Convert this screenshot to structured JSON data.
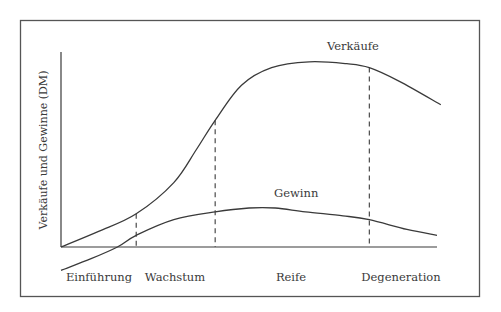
{
  "chart_data": {
    "type": "line",
    "title": "",
    "xlabel": "",
    "ylabel": "Verkäufe und Gewinne (DM)",
    "xlim": [
      0,
      100
    ],
    "ylim": [
      -15,
      100
    ],
    "grid": false,
    "legend": "none",
    "phases": [
      {
        "label": "Einführung",
        "start": 0,
        "end": 20
      },
      {
        "label": "Wachstum",
        "start": 20,
        "end": 41
      },
      {
        "label": "Reife",
        "start": 41,
        "end": 82
      },
      {
        "label": "Degeneration",
        "start": 82,
        "end": 101
      }
    ],
    "phase_boundaries": [
      20,
      41,
      82
    ],
    "series": [
      {
        "name": "Verkäufe",
        "label": "Verkäufe",
        "color": "#3a3a3a",
        "x": [
          0,
          10,
          20,
          30,
          36,
          41,
          48,
          56,
          66,
          76,
          82,
          90,
          101
        ],
        "y": [
          0,
          8,
          17,
          33,
          50,
          65,
          83,
          92,
          95,
          94,
          92,
          85,
          73
        ]
      },
      {
        "name": "Gewinn",
        "label": "Gewinn",
        "color": "#3a3a3a",
        "x": [
          0,
          8,
          15,
          20,
          30,
          41,
          50,
          57,
          65,
          75,
          82,
          92,
          100
        ],
        "y": [
          -12,
          -6,
          0,
          6,
          14,
          18,
          20,
          20,
          18,
          16,
          14,
          9,
          6
        ]
      }
    ],
    "annotations": [
      {
        "text": "Verkäufe",
        "series": "Verkäufe"
      },
      {
        "text": "Gewinn",
        "series": "Gewinn"
      }
    ]
  },
  "colors": {
    "ink": "#3a3a3a",
    "frame": "#555555",
    "background": "#ffffff"
  }
}
